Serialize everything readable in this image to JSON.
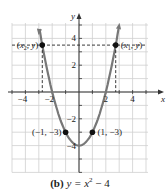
{
  "chart_data": {
    "type": "line",
    "caption_prefix": "(b)",
    "caption_eq": "y = x",
    "caption_exp": "2",
    "caption_tail": " − 4",
    "xlabel": "x",
    "ylabel": "y",
    "xlim": [
      -5,
      5
    ],
    "ylim": [
      -6,
      5
    ],
    "grid": true,
    "x_ticks": [
      "−4",
      "−2",
      "2",
      "4"
    ],
    "y_ticks": [
      "4",
      "2",
      "−2",
      "−4"
    ],
    "series": [
      {
        "name": "y = x^2 - 4",
        "function": "x^2 - 4",
        "x_range": [
          -2.95,
          2.95
        ],
        "color": "#777777"
      }
    ],
    "dashed_line_y": 3.5,
    "points": [
      {
        "label": "(x2, y)",
        "x": -2.74,
        "y": 3.5
      },
      {
        "label": "(x1, y)",
        "x": 2.74,
        "y": 3.5
      },
      {
        "label": "(−1, −3)",
        "x": -1,
        "y": -3
      },
      {
        "label": "(1, −3)",
        "x": 1,
        "y": -3
      }
    ],
    "annotations": [
      "(x2, y)",
      "(x1, y)",
      "(−1, −3)",
      "(1, −3)"
    ]
  }
}
